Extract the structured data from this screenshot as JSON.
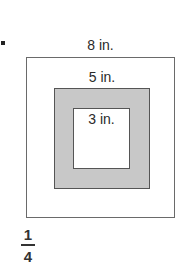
{
  "problem": {
    "marker": "."
  },
  "figure": {
    "type": "nested-squares",
    "colors": {
      "outer_fill": "#ffffff",
      "middle_fill": "#c8c8c8",
      "inner_fill": "#ffffff",
      "stroke": "#555555"
    },
    "squares": [
      {
        "label": "8 in.",
        "side": 8,
        "fill": "white"
      },
      {
        "label": "5 in.",
        "side": 5,
        "fill": "gray"
      },
      {
        "label": "3 in.",
        "side": 3,
        "fill": "white"
      }
    ]
  },
  "answer": {
    "numerator": "1",
    "denominator": "4"
  }
}
